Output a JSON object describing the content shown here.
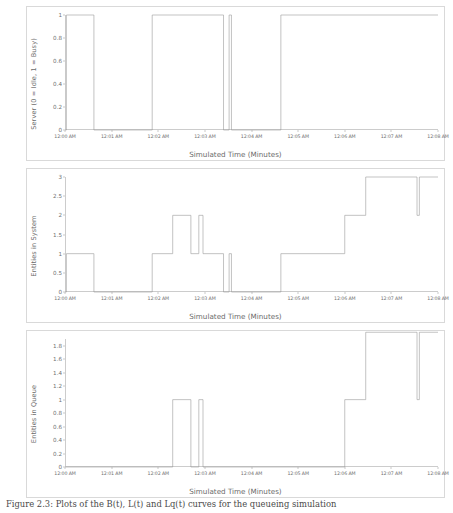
{
  "figure": {
    "caption": "Figure 2.3: Plots of the B(t), L(t) and Lq(t) curves for the queueing simulation",
    "xlabel": "Simulated Time (Minutes)",
    "xticks": [
      "12:00 AM",
      "12:01 AM",
      "12:02 AM",
      "12:03 AM",
      "12:04 AM",
      "12:05 AM",
      "12:06 AM",
      "12:07 AM",
      "12:08 AM"
    ],
    "line_color": "#9a9a9a",
    "axis_color": "#cccccc",
    "frame_color": "#d9d9d9"
  },
  "chart_data": [
    {
      "type": "line",
      "panel": 1,
      "title": "",
      "xlabel": "Simulated Time (Minutes)",
      "ylabel": "Server (0 = Idle, 1 = Busy)",
      "yticks": [
        "0",
        "0.2",
        "0.4",
        "0.6",
        "0.8",
        "1"
      ],
      "ylim": [
        0,
        1
      ],
      "xlim": [
        0,
        8
      ],
      "grid": false,
      "legend": "none",
      "step": "post",
      "x": [
        0.0,
        0.03,
        0.62,
        1.87,
        3.4,
        3.52,
        3.57,
        4.63,
        8.0
      ],
      "y": [
        0,
        1,
        0,
        1,
        0,
        1,
        0,
        1,
        1
      ]
    },
    {
      "type": "line",
      "panel": 2,
      "title": "",
      "xlabel": "Simulated Time (Minutes)",
      "ylabel": "Entities in System",
      "yticks": [
        "0",
        "0.5",
        "1",
        "1.5",
        "2",
        "2.5",
        "3"
      ],
      "ylim": [
        0,
        3
      ],
      "xlim": [
        0,
        8
      ],
      "grid": false,
      "legend": "none",
      "step": "post",
      "x": [
        0.0,
        0.03,
        0.62,
        1.87,
        2.31,
        2.7,
        2.87,
        2.96,
        3.4,
        3.52,
        3.57,
        4.63,
        6.0,
        6.45,
        7.55,
        7.6,
        8.0
      ],
      "y": [
        0,
        1,
        0,
        1,
        2,
        1,
        2,
        1,
        0,
        1,
        0,
        1,
        2,
        3,
        2,
        3,
        3
      ]
    },
    {
      "type": "line",
      "panel": 3,
      "title": "",
      "xlabel": "Simulated Time (Minutes)",
      "ylabel": "Entities in Queue",
      "yticks": [
        "0",
        "0.2",
        "0.4",
        "0.6",
        "0.8",
        "1",
        "1.2",
        "1.4",
        "1.6",
        "1.8"
      ],
      "ylim": [
        0,
        1.9
      ],
      "xlim": [
        0,
        8
      ],
      "grid": false,
      "legend": "none",
      "step": "post",
      "x": [
        0.0,
        2.31,
        2.7,
        2.87,
        2.96,
        6.0,
        6.45,
        7.55,
        7.6,
        8.0
      ],
      "y": [
        0,
        1,
        0,
        1,
        0,
        1,
        2,
        1,
        2,
        2
      ]
    }
  ]
}
